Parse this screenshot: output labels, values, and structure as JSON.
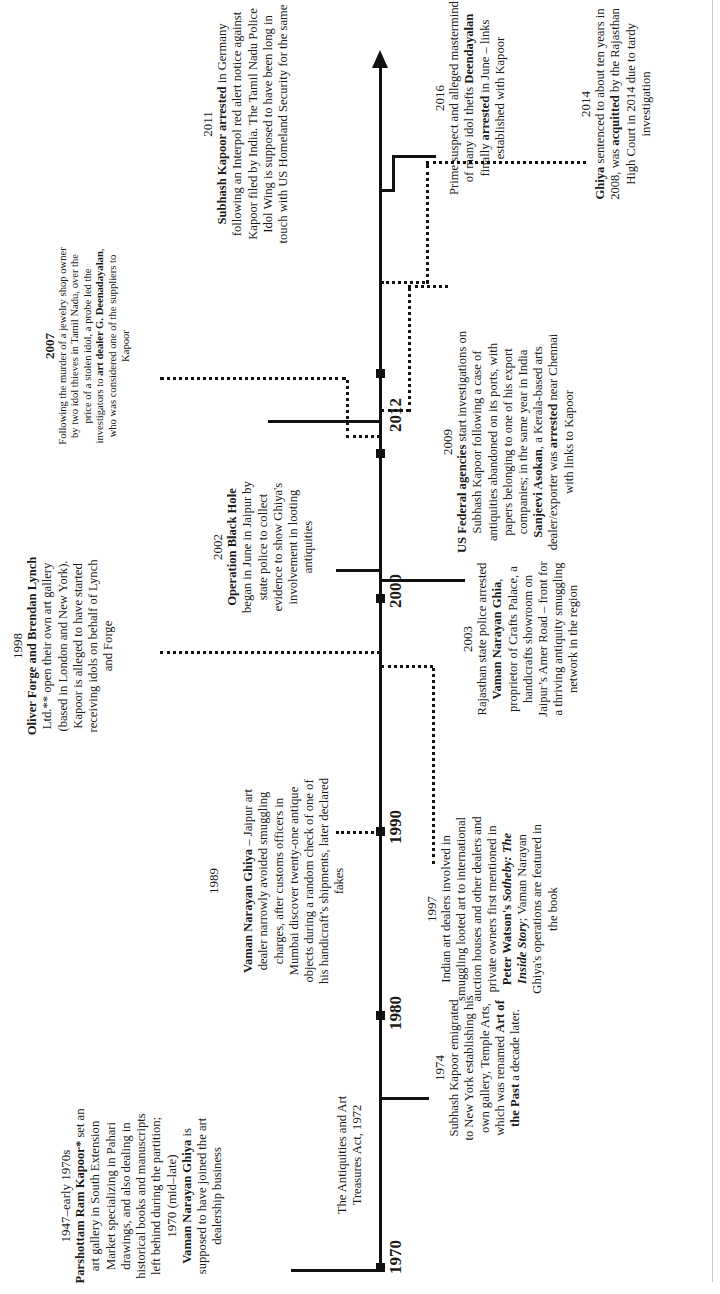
{
  "diagram": {
    "type": "timeline",
    "orientation": "rotated-90-ccw",
    "axis_ticks": [
      "1970",
      "1980",
      "1990",
      "2000",
      "2012"
    ],
    "events": [
      {
        "id": "e1947",
        "year": "1947–early 1970s",
        "parts": [
          {
            "b": "Parshottam Ram Kapoor*"
          },
          {
            "t": " set an art gallery in South Extension Market specializing in Pahari drawings, and also dealing in historical books and manuscripts left behind during the partition;"
          }
        ],
        "year2": "1970 (mid–late)",
        "parts2": [
          {
            "b": "Vaman Narayan Ghiya"
          },
          {
            "t": " is supposed to have joined the art dealership business"
          }
        ]
      },
      {
        "id": "e1972",
        "year": "",
        "parts": [
          {
            "t": "The Antiquities and Art Treasures Act, 1972"
          }
        ]
      },
      {
        "id": "e1974",
        "year": "1974",
        "parts": [
          {
            "t": "Subhash Kapoor emigrated to New York establishing his own gallery, Temple Arts, which was renamed "
          },
          {
            "b": "Art of the Past"
          },
          {
            "t": " a decade later."
          }
        ]
      },
      {
        "id": "e1989",
        "year": "1989",
        "parts": [
          {
            "b": "Vaman Narayan Ghiya"
          },
          {
            "t": " – Jaipur art dealer narrowly avoided smuggling charges, after customs officers in Mumbai discover twenty-one antique objects during a random check of one of his handicraft’s shipments, later declared fakes"
          }
        ]
      },
      {
        "id": "e1997",
        "year": "1997",
        "parts": [
          {
            "t": "Indian art dealers involved in smuggling looted art to international auction houses and other dealers and private owners first mentioned in "
          },
          {
            "b": "Peter Watson's "
          },
          {
            "bi": "Sotheby: The Inside Story"
          },
          {
            "t": "; Vaman Narayan Ghiya's operations are featured in the book"
          }
        ]
      },
      {
        "id": "e1998",
        "year": "1998",
        "parts": [
          {
            "b": "Oliver Forge and Brendan Lynch"
          },
          {
            "t": " Ltd.** open their own art gallery (based in London and New York). Kapoor is alleged to have started receiving idols on behalf of Lynch and Forge"
          }
        ]
      },
      {
        "id": "e2002",
        "year": "2002",
        "parts": [
          {
            "b": "Operation Black Hole"
          },
          {
            "t": " began in June in Jaipur by state police to collect evidence to show Ghiya's involvement in looting antiquities"
          }
        ]
      },
      {
        "id": "e2003",
        "year": "2003",
        "parts": [
          {
            "t": "Rajasthan state police arrested "
          },
          {
            "b": "Vaman Narayan Ghia"
          },
          {
            "t": ", proprietor of Crafts Palace, a handicrafts showroom on Jaipur’s Amer Road – front for a thriving antiquity smuggling network in the region"
          }
        ]
      },
      {
        "id": "e2007",
        "year": "2007",
        "parts": [
          {
            "t": "Following the murder of a jewelry shop owner by two idol thieves in Tamil Nadu, over the price of a stolen idol, a probe led the investigators to "
          },
          {
            "b": "art dealer G. Deenadayalan"
          },
          {
            "t": ", who was considered one of the suppliers to Kapoor"
          }
        ]
      },
      {
        "id": "e2009",
        "year": "2009",
        "parts": [
          {
            "b": "US Federal agencies"
          },
          {
            "t": " start investigations on Subhash Kapoor following a case of antiquities abandoned on its ports, with papers belonging to one of his export companies; in the same year in India "
          },
          {
            "b": "Sanjeevi Asokan"
          },
          {
            "t": ", a Kerala-based arts dealer/exporter was "
          },
          {
            "b": "arrested"
          },
          {
            "t": " near Chennai with links to Kapoor"
          }
        ]
      },
      {
        "id": "e2011",
        "year": "2011",
        "parts": [
          {
            "b": "Subhash Kapoor arrested"
          },
          {
            "t": " in Germany following an Interpol red alert notice against Kapoor filed by India. The Tamil Nadu Police Idol Wing is supposed to have been long in touch with US Homeland Security for the same"
          }
        ]
      },
      {
        "id": "e2014",
        "year": "2014",
        "parts": [
          {
            "b": "Ghiya"
          },
          {
            "t": " sentenced to about ten years in 2008, was "
          },
          {
            "b": "acquitted"
          },
          {
            "t": " by the Rajasthan High Court in 2014 due to tardy investigation"
          }
        ]
      },
      {
        "id": "e2016",
        "year": "2016",
        "parts": [
          {
            "t": "Prime suspect and alleged mastermind of many idol thefts "
          },
          {
            "b": "Deendayalan"
          },
          {
            "t": " finally "
          },
          {
            "b": "arrested"
          },
          {
            "t": " in June – links established with Kapoor"
          }
        ]
      }
    ]
  }
}
